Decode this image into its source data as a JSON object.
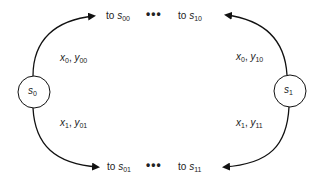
{
  "diagram": {
    "nodes": [
      {
        "id": "s0",
        "var": "s",
        "sub": "0"
      },
      {
        "id": "s1",
        "var": "s",
        "sub": "1"
      }
    ],
    "targets": {
      "top_left": {
        "prefix": "to ",
        "var": "s",
        "sub": "00"
      },
      "top_right": {
        "prefix": "to ",
        "var": "s",
        "sub": "10"
      },
      "bottom_left": {
        "prefix": "to ",
        "var": "s",
        "sub": "01"
      },
      "bottom_right": {
        "prefix": "to ",
        "var": "s",
        "sub": "11"
      },
      "ellipsis": "•••"
    },
    "edge_labels": {
      "s0_top": {
        "a": "x",
        "a_sub": "0",
        "sep": ", ",
        "b": "y",
        "b_sub": "00"
      },
      "s0_bottom": {
        "a": "x",
        "a_sub": "1",
        "sep": ", ",
        "b": "y",
        "b_sub": "01"
      },
      "s1_top": {
        "a": "x",
        "a_sub": "0",
        "sep": ", ",
        "b": "y",
        "b_sub": "10"
      },
      "s1_bottom": {
        "a": "x",
        "a_sub": "1",
        "sep": ", ",
        "b": "y",
        "b_sub": "11"
      }
    },
    "colors": {
      "stroke": "#111111",
      "text": "#222222"
    }
  }
}
